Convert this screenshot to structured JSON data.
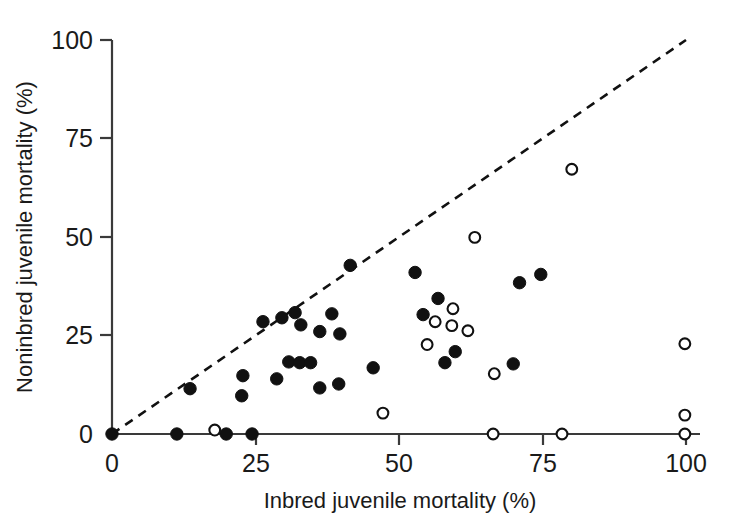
{
  "chart_data": {
    "type": "scatter",
    "title": "",
    "xlabel": "Inbred juvenile mortality (%)",
    "ylabel": "Noninbred juvenile mortality (%)",
    "xlim": [
      0,
      100
    ],
    "ylim": [
      0,
      100
    ],
    "xticks": [
      0,
      25,
      50,
      75,
      100
    ],
    "yticks": [
      0,
      25,
      50,
      75,
      100
    ],
    "xtick_labels": [
      "0",
      "25",
      "50",
      "75",
      "100"
    ],
    "ytick_labels": [
      "0",
      "25",
      "50",
      "75",
      "100"
    ],
    "grid": false,
    "legend": "none",
    "annotations": [
      {
        "name": "one-to-one-line",
        "style": "dashed",
        "from": [
          0,
          0
        ],
        "to": [
          100,
          100
        ],
        "color": "#111111"
      }
    ],
    "series": [
      {
        "name": "filled-circles",
        "marker": "filled-circle",
        "color": "#111111",
        "points": [
          [
            0,
            0
          ],
          [
            11.3,
            0
          ],
          [
            19.9,
            0
          ],
          [
            24.4,
            0
          ],
          [
            13.6,
            11.5
          ],
          [
            22.6,
            9.7
          ],
          [
            22.8,
            14.8
          ],
          [
            26.3,
            28.5
          ],
          [
            28.7,
            14.0
          ],
          [
            29.6,
            29.5
          ],
          [
            30.8,
            18.3
          ],
          [
            31.9,
            30.8
          ],
          [
            32.7,
            18.1
          ],
          [
            32.9,
            27.7
          ],
          [
            34.6,
            18.1
          ],
          [
            36.2,
            11.7
          ],
          [
            36.2,
            26.0
          ],
          [
            38.3,
            30.5
          ],
          [
            39.5,
            12.7
          ],
          [
            39.7,
            25.4
          ],
          [
            41.5,
            42.8
          ],
          [
            45.5,
            16.8
          ],
          [
            52.8,
            41.0
          ],
          [
            54.2,
            30.3
          ],
          [
            56.8,
            34.4
          ],
          [
            58.0,
            18.1
          ],
          [
            59.8,
            20.9
          ],
          [
            69.9,
            17.8
          ],
          [
            71.0,
            38.4
          ],
          [
            74.7,
            40.5
          ]
        ]
      },
      {
        "name": "open-circles",
        "marker": "open-circle",
        "color": "#111111",
        "points": [
          [
            17.9,
            1.0
          ],
          [
            47.2,
            5.3
          ],
          [
            54.9,
            22.7
          ],
          [
            56.3,
            28.5
          ],
          [
            59.4,
            31.8
          ],
          [
            59.2,
            27.5
          ],
          [
            62.0,
            26.2
          ],
          [
            63.2,
            49.9
          ],
          [
            66.4,
            0
          ],
          [
            66.6,
            15.3
          ],
          [
            78.4,
            0
          ],
          [
            80.1,
            67.2
          ],
          [
            99.8,
            0
          ],
          [
            99.8,
            4.8
          ],
          [
            99.8,
            22.9
          ]
        ]
      }
    ]
  },
  "axes": {
    "x_title": "Inbred juvenile mortality (%)",
    "y_title": "Noninbred juvenile mortality (%)",
    "x_tick_0": "0",
    "x_tick_1": "25",
    "x_tick_2": "50",
    "x_tick_3": "75",
    "x_tick_4": "100",
    "y_tick_0": "0",
    "y_tick_1": "25",
    "y_tick_2": "50",
    "y_tick_3": "75",
    "y_tick_4": "100"
  }
}
